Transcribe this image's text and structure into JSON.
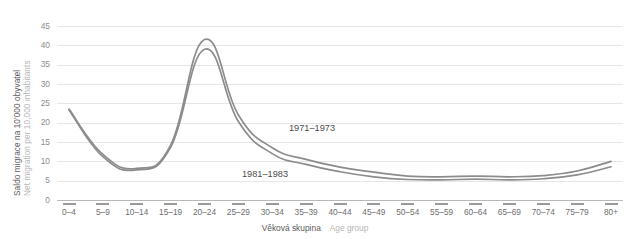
{
  "chart_data": {
    "type": "line",
    "title": "",
    "categories": [
      "0–4",
      "5–9",
      "10–14",
      "15–19",
      "20–24",
      "25–29",
      "30–34",
      "35–39",
      "40–44",
      "45–49",
      "50–54",
      "55–59",
      "60–64",
      "65–69",
      "70–74",
      "75–79",
      "80+"
    ],
    "series": [
      {
        "name": "1971–1973",
        "color": "#8c8c8c",
        "values": [
          23.5,
          11.8,
          8.2,
          14.2,
          41.5,
          22.0,
          13.5,
          10.5,
          8.5,
          7.2,
          6.2,
          6.0,
          6.2,
          6.0,
          6.3,
          7.5,
          10.0
        ]
      },
      {
        "name": "1981–1983",
        "color": "#8c8c8c",
        "values": [
          23.3,
          11.2,
          7.8,
          13.6,
          39.0,
          20.3,
          12.0,
          9.2,
          7.3,
          6.0,
          5.3,
          5.2,
          5.4,
          5.2,
          5.5,
          6.5,
          8.6
        ]
      }
    ],
    "xlabel_cz": "Věková skupina",
    "xlabel_en": "Age group",
    "ylabel_cz": "Saldo migrace na 10'000 obyvatel",
    "ylabel_en": "Net migration per 10,000 inhabitants",
    "yticks": [
      0,
      5,
      10,
      15,
      20,
      25,
      30,
      35,
      40,
      45
    ],
    "ylim": [
      0,
      45
    ],
    "grid": true,
    "legend_position": "inline-annotations"
  },
  "annotations": {
    "upper_label": "1971–1973",
    "lower_label": "1981–1983"
  },
  "colors": {
    "line": "#8c8c8c",
    "grid": "#e6e6e6",
    "axis": "#b8b8b8",
    "tick_text": "#8d8d8d",
    "label_cz": "#595959",
    "label_en": "#b6b6b6"
  }
}
